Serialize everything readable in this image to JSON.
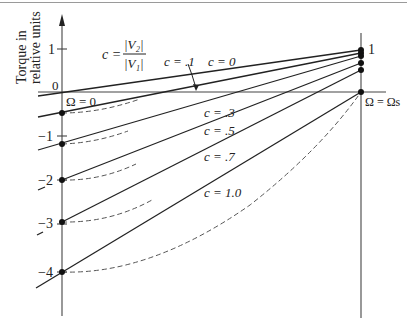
{
  "figure": {
    "ylabel_line1": "Torque in",
    "ylabel_line2": "relative units",
    "definition": {
      "lhs": "c =",
      "numerator": "|V₂|",
      "denominator": "|V₁|"
    },
    "y_ticks": [
      {
        "label": "1",
        "value": 1
      },
      {
        "label": "0",
        "value": 0
      },
      {
        "label": "−1",
        "value": -1
      },
      {
        "label": "−2",
        "value": -2
      },
      {
        "label": "−3",
        "value": -3
      },
      {
        "label": "−4",
        "value": -4
      }
    ],
    "x_labels": {
      "origin": "Ω = 0",
      "end": "Ω = Ωs"
    },
    "right_axis_label": "1",
    "line_labels": [
      {
        "c": "c = 0"
      },
      {
        "c": "c = .1"
      },
      {
        "c": "c = .3"
      },
      {
        "c": "c = .5"
      },
      {
        "c": "c = .7"
      },
      {
        "c": "c = 1.0"
      }
    ]
  },
  "colors": {
    "line": "#222222",
    "axis": "#444444",
    "dashed": "#555555"
  }
}
